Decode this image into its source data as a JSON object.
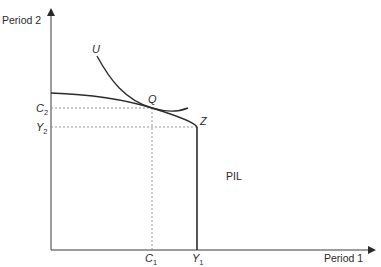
{
  "diagram": {
    "type": "intertemporal-consumption",
    "axes": {
      "x_label": "Period 1",
      "y_label": "Period 2"
    },
    "curves": {
      "indifference_label": "U",
      "tangent_point_label": "Q",
      "endowment_point_label": "Z"
    },
    "ticks": {
      "c1": {
        "main": "C",
        "sub": "1"
      },
      "y1": {
        "main": "Y",
        "sub": "1"
      },
      "c2": {
        "main": "C",
        "sub": "2"
      },
      "y2": {
        "main": "Y",
        "sub": "2"
      }
    },
    "region_label": "PIL",
    "colors": {
      "axis": "#3a3a3a",
      "curve": "#2b2b2b",
      "dashed": "#8a8a8a"
    }
  }
}
